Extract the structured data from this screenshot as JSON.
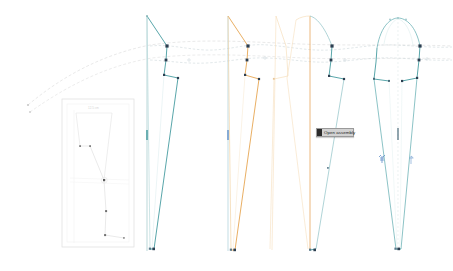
{
  "app": {
    "name": "pattern-drafting-canvas",
    "background": "#ffffff"
  },
  "colors": {
    "teal": "#2f8f94",
    "teal_light": "#7fc0c4",
    "teal_pale": "#bfe0e2",
    "orange": "#e39a3c",
    "orange_light": "#efc488",
    "orange_pale": "#f6dfbd",
    "gray_guide": "#d9d9d9",
    "gray_faint": "#ececec",
    "node_dark": "#2c3e50",
    "node_mid": "#5b7a8c",
    "inset_border": "#e2e2e2",
    "tooltip_bg": "#d2d2d2",
    "tooltip_border": "#9a9a9a",
    "tooltip_text": "#1d1d1d",
    "notch_blue": "#4a7fc1"
  },
  "tooltip": {
    "label": "Open assembly",
    "x": 316,
    "y": 128,
    "width": 38,
    "height": 9
  },
  "inset": {
    "name": "detail-frame",
    "x": 62,
    "y": 99,
    "width": 72,
    "height": 148,
    "title": "Detail",
    "measure": "12.5 cm"
  },
  "guides": {
    "upper_curve_label": "upper-guide-curve",
    "lower_curve_label": "lower-guide-curve",
    "sweep_label": "left-sweep-curves"
  },
  "panels": [
    {
      "id": "panel-1",
      "name": "pattern-panel-left",
      "color": "teal",
      "center_x": 152,
      "top_y": 16,
      "bottom_y": 251,
      "grainline": true,
      "selected": true
    },
    {
      "id": "panel-2",
      "name": "pattern-panel-second",
      "color": "orange",
      "center_x": 233,
      "top_y": 16,
      "bottom_y": 252,
      "grainline": true,
      "selected": false
    },
    {
      "id": "panel-3",
      "name": "pattern-panel-third",
      "color": "orange-pale",
      "center_x": 310,
      "top_y": 16,
      "bottom_y": 252,
      "grainline": true,
      "selected": false
    },
    {
      "id": "panel-4",
      "name": "pattern-panel-right",
      "color": "teal",
      "center_x": 398,
      "top_y": 16,
      "bottom_y": 252,
      "grainline": true,
      "selected": false
    }
  ],
  "markers": {
    "notch_left": "notch-marker-left",
    "notch_right": "notch-marker-right",
    "grain_tick": "grainline-tick"
  }
}
